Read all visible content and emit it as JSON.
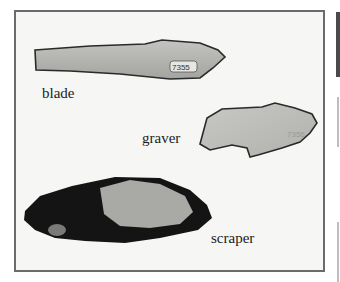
{
  "figure": {
    "labels": {
      "blade": "blade",
      "graver": "graver",
      "scraper": "scraper"
    },
    "blade_catalog_number": "7355",
    "graver_catalog_number": "7356"
  },
  "colors": {
    "frame_border": "#6b6b6b",
    "background": "#f6f6f4",
    "stone_light": "#b5b5b2",
    "stone_dark": "#151515"
  }
}
